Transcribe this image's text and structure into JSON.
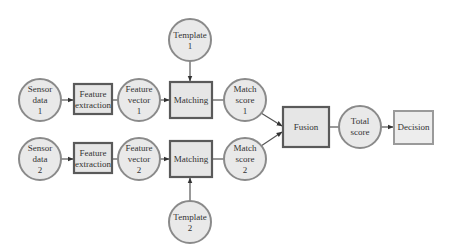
{
  "diagram": {
    "type": "flowchart",
    "title": "",
    "nodes": [
      {
        "id": "sensor1",
        "shape": "circle",
        "lines": [
          "Sensor",
          "data",
          "1"
        ]
      },
      {
        "id": "fe1",
        "shape": "box",
        "lines": [
          "Feature",
          "extraction"
        ]
      },
      {
        "id": "fv1",
        "shape": "circle",
        "lines": [
          "Feature",
          "vector",
          "1"
        ]
      },
      {
        "id": "match1",
        "shape": "box",
        "lines": [
          "Matching"
        ]
      },
      {
        "id": "template1",
        "shape": "circle",
        "lines": [
          "Template",
          "1"
        ]
      },
      {
        "id": "ms1",
        "shape": "circle",
        "lines": [
          "Match",
          "score",
          "1"
        ]
      },
      {
        "id": "sensor2",
        "shape": "circle",
        "lines": [
          "Sensor",
          "data",
          "2"
        ]
      },
      {
        "id": "fe2",
        "shape": "box",
        "lines": [
          "Feature",
          "extraction"
        ]
      },
      {
        "id": "fv2",
        "shape": "circle",
        "lines": [
          "Feature",
          "vector",
          "2"
        ]
      },
      {
        "id": "match2",
        "shape": "box",
        "lines": [
          "Matching"
        ]
      },
      {
        "id": "template2",
        "shape": "circle",
        "lines": [
          "Template",
          "2"
        ]
      },
      {
        "id": "ms2",
        "shape": "circle",
        "lines": [
          "Match",
          "score",
          "2"
        ]
      },
      {
        "id": "fusion",
        "shape": "box",
        "lines": [
          "Fusion"
        ]
      },
      {
        "id": "total",
        "shape": "circle",
        "lines": [
          "Total",
          "score"
        ]
      },
      {
        "id": "decision",
        "shape": "box",
        "lines": [
          "Decision"
        ]
      }
    ],
    "edges": [
      {
        "from": "sensor1",
        "to": "fe1",
        "arrow": true
      },
      {
        "from": "fe1",
        "to": "fv1",
        "arrow": false
      },
      {
        "from": "fv1",
        "to": "match1",
        "arrow": true
      },
      {
        "from": "template1",
        "to": "match1",
        "arrow": true
      },
      {
        "from": "match1",
        "to": "ms1",
        "arrow": false
      },
      {
        "from": "ms1",
        "to": "fusion",
        "arrow": true
      },
      {
        "from": "sensor2",
        "to": "fe2",
        "arrow": true
      },
      {
        "from": "fe2",
        "to": "fv2",
        "arrow": false
      },
      {
        "from": "fv2",
        "to": "match2",
        "arrow": true
      },
      {
        "from": "template2",
        "to": "match2",
        "arrow": true
      },
      {
        "from": "match2",
        "to": "ms2",
        "arrow": false
      },
      {
        "from": "ms2",
        "to": "fusion",
        "arrow": true
      },
      {
        "from": "fusion",
        "to": "total",
        "arrow": false
      },
      {
        "from": "total",
        "to": "decision",
        "arrow": true
      }
    ]
  },
  "labels": {
    "sensor1": [
      "Sensor",
      "data",
      "1"
    ],
    "fe1": [
      "Feature",
      "extraction"
    ],
    "fv1": [
      "Feature",
      "vector",
      "1"
    ],
    "match1": "Matching",
    "template1": [
      "Template",
      "1"
    ],
    "ms1": [
      "Match",
      "score",
      "1"
    ],
    "sensor2": [
      "Sensor",
      "data",
      "2"
    ],
    "fe2": [
      "Feature",
      "extraction"
    ],
    "fv2": [
      "Feature",
      "vector",
      "2"
    ],
    "match2": "Matching",
    "template2": [
      "Template",
      "2"
    ],
    "ms2": [
      "Match",
      "score",
      "2"
    ],
    "fusion": "Fusion",
    "total": [
      "Total",
      "score"
    ],
    "decision": "Decision"
  },
  "colors": {
    "node_fill": "#e9e9e9",
    "circle_stroke": "#8a8a8a",
    "box_stroke": "#5a5a5a",
    "decision_stroke": "#9a9a9a",
    "edge": "#555555",
    "text": "#333333"
  }
}
